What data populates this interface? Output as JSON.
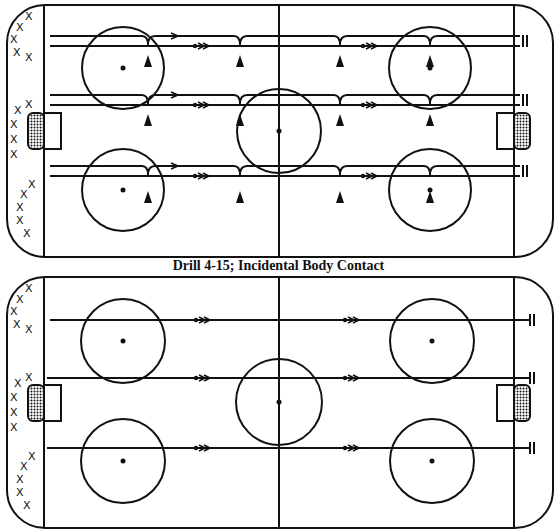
{
  "caption": "Drill 4-15; Incidental Body Contact",
  "colors": {
    "ink": "#111111",
    "background": "#ffffff"
  },
  "diagrams": [
    {
      "name": "top-rink",
      "description": "Three lanes of paired skating lines with cone/pylon markers and body-contact bumps",
      "player_symbol": "X",
      "marker_symbol": "triangle-cone",
      "lanes": 3,
      "end_symbol": "stop-bars"
    },
    {
      "name": "bottom-rink",
      "description": "Three single skating lanes across the full ice ending at stop bars",
      "player_symbol": "X",
      "lanes": 3,
      "end_symbol": "stop-bars"
    }
  ]
}
